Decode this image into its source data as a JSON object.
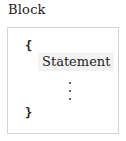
{
  "diagram": {
    "title": "Block",
    "open_brace": "{",
    "close_brace": "}",
    "statement_label": "Statement",
    "continuation": "vertical-ellipsis"
  }
}
